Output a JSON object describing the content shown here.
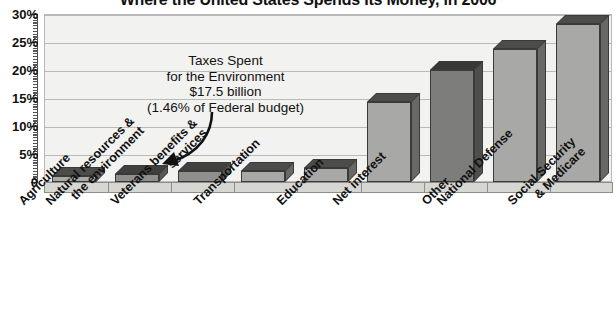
{
  "chart_data": {
    "type": "bar",
    "title": "Where the United States Spends Its Money, in 2006",
    "xlabel": "",
    "ylabel": "",
    "ylim": [
      0,
      30
    ],
    "ytick_labels": [
      "0",
      "5%",
      "10%",
      "15%",
      "20%",
      "25%",
      "30%"
    ],
    "ytick_values": [
      0,
      5,
      10,
      15,
      20,
      25,
      30
    ],
    "grid": true,
    "legend": "none",
    "categories": [
      "Agriculture",
      "Natural resources & the environment",
      "Veterans benefits & services",
      "Transportation",
      "Education",
      "Net interest",
      "Other",
      "National Defense",
      "Social Security & Medicare"
    ],
    "category_lines": [
      [
        "Agriculture",
        ""
      ],
      [
        "Natural resources &",
        "the environment"
      ],
      [
        "Veterans benefits &",
        "services"
      ],
      [
        "Transportation",
        ""
      ],
      [
        "Education",
        ""
      ],
      [
        "Net interest",
        ""
      ],
      [
        "Other",
        ""
      ],
      [
        "National Defense",
        ""
      ],
      [
        "Social Security",
        "& Medicare"
      ]
    ],
    "values": [
      1.0,
      1.46,
      1.9,
      1.9,
      2.5,
      14.3,
      20.0,
      23.8,
      28.3
    ],
    "bar_colors": [
      "#a8a8a6",
      "#8f8f8d",
      "#8f8f8d",
      "#a8a8a6",
      "#a8a8a6",
      "#a8a8a6",
      "#7d7d7b",
      "#a8a8a6",
      "#a8a8a6"
    ],
    "annotations": [
      {
        "lines": [
          "Taxes Spent",
          "for the Environment",
          "$17.5 billion",
          "(1.46% of Federal budget)"
        ],
        "points_to": "Natural resources & the environment"
      }
    ]
  },
  "annotation": {
    "line1": "Taxes Spent",
    "line2": "for the Environment",
    "line3": "$17.5 billion",
    "line4": "(1.46% of Federal budget)"
  },
  "colors": {
    "plot_background": "#f2f2f0",
    "gridline": "#b9b9b7",
    "bar_light": "#a8a8a6",
    "bar_dark": "#7d7d7b",
    "bar_outline": "#3a3a38",
    "text": "#111111"
  }
}
